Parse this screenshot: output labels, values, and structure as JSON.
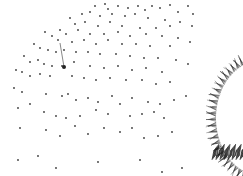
{
  "scene": {
    "background": "#ffffff",
    "dot_color": "#3a3a3a",
    "object_color": "#2a2a2a",
    "dots": [
      [
        95,
        6
      ],
      [
        105,
        4
      ],
      [
        108,
        9
      ],
      [
        118,
        6
      ],
      [
        128,
        8
      ],
      [
        138,
        6
      ],
      [
        145,
        10
      ],
      [
        152,
        6
      ],
      [
        160,
        8
      ],
      [
        170,
        5
      ],
      [
        178,
        12
      ],
      [
        188,
        6
      ],
      [
        193,
        14
      ],
      [
        82,
        14
      ],
      [
        90,
        12
      ],
      [
        100,
        16
      ],
      [
        112,
        14
      ],
      [
        125,
        16
      ],
      [
        135,
        14
      ],
      [
        148,
        18
      ],
      [
        165,
        20
      ],
      [
        180,
        22
      ],
      [
        192,
        26
      ],
      [
        70,
        18
      ],
      [
        75,
        24
      ],
      [
        85,
        22
      ],
      [
        98,
        26
      ],
      [
        110,
        22
      ],
      [
        122,
        26
      ],
      [
        140,
        28
      ],
      [
        156,
        28
      ],
      [
        170,
        26
      ],
      [
        60,
        30
      ],
      [
        66,
        34
      ],
      [
        78,
        30
      ],
      [
        90,
        34
      ],
      [
        104,
        34
      ],
      [
        118,
        32
      ],
      [
        130,
        36
      ],
      [
        146,
        34
      ],
      [
        162,
        36
      ],
      [
        178,
        38
      ],
      [
        190,
        42
      ],
      [
        45,
        32
      ],
      [
        52,
        36
      ],
      [
        58,
        40
      ],
      [
        72,
        42
      ],
      [
        84,
        40
      ],
      [
        96,
        44
      ],
      [
        108,
        40
      ],
      [
        122,
        44
      ],
      [
        136,
        44
      ],
      [
        150,
        46
      ],
      [
        170,
        46
      ],
      [
        34,
        44
      ],
      [
        40,
        48
      ],
      [
        48,
        50
      ],
      [
        56,
        52
      ],
      [
        64,
        50
      ],
      [
        76,
        52
      ],
      [
        88,
        52
      ],
      [
        100,
        54
      ],
      [
        116,
        54
      ],
      [
        130,
        56
      ],
      [
        144,
        58
      ],
      [
        158,
        58
      ],
      [
        176,
        60
      ],
      [
        188,
        64
      ],
      [
        24,
        56
      ],
      [
        30,
        62
      ],
      [
        38,
        60
      ],
      [
        44,
        64
      ],
      [
        52,
        66
      ],
      [
        62,
        66
      ],
      [
        74,
        62
      ],
      [
        90,
        66
      ],
      [
        104,
        68
      ],
      [
        118,
        66
      ],
      [
        132,
        70
      ],
      [
        146,
        68
      ],
      [
        162,
        72
      ],
      [
        16,
        70
      ],
      [
        22,
        72
      ],
      [
        30,
        76
      ],
      [
        40,
        74
      ],
      [
        50,
        76
      ],
      [
        72,
        76
      ],
      [
        84,
        78
      ],
      [
        96,
        80
      ],
      [
        110,
        78
      ],
      [
        126,
        80
      ],
      [
        142,
        80
      ],
      [
        156,
        84
      ],
      [
        170,
        82
      ],
      [
        14,
        88
      ],
      [
        22,
        92
      ],
      [
        46,
        94
      ],
      [
        62,
        96
      ],
      [
        68,
        94
      ],
      [
        76,
        100
      ],
      [
        88,
        98
      ],
      [
        98,
        102
      ],
      [
        112,
        96
      ],
      [
        120,
        104
      ],
      [
        132,
        98
      ],
      [
        148,
        102
      ],
      [
        160,
        104
      ],
      [
        174,
        100
      ],
      [
        186,
        96
      ],
      [
        18,
        108
      ],
      [
        30,
        104
      ],
      [
        44,
        112
      ],
      [
        56,
        116
      ],
      [
        66,
        118
      ],
      [
        80,
        116
      ],
      [
        96,
        110
      ],
      [
        108,
        114
      ],
      [
        130,
        116
      ],
      [
        142,
        114
      ],
      [
        154,
        112
      ],
      [
        164,
        118
      ],
      [
        20,
        128
      ],
      [
        46,
        130
      ],
      [
        60,
        136
      ],
      [
        75,
        126
      ],
      [
        88,
        134
      ],
      [
        104,
        128
      ],
      [
        120,
        132
      ],
      [
        132,
        128
      ],
      [
        144,
        138
      ],
      [
        158,
        136
      ],
      [
        172,
        132
      ],
      [
        18,
        160
      ],
      [
        38,
        156
      ],
      [
        56,
        168
      ],
      [
        98,
        162
      ],
      [
        140,
        160
      ],
      [
        162,
        172
      ],
      [
        182,
        168
      ]
    ],
    "highlight_dot": [
      64,
      67
    ],
    "highlight_line": [
      [
        60,
        43
      ],
      [
        64,
        67
      ]
    ]
  }
}
